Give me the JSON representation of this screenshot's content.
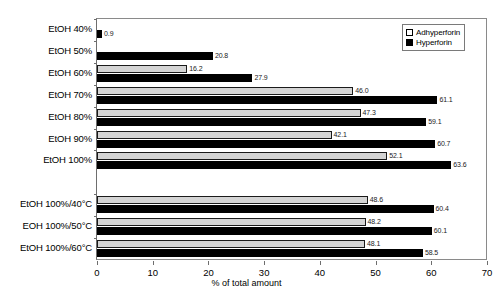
{
  "chart_data": {
    "type": "bar",
    "orientation": "horizontal",
    "title": "",
    "xlabel": "% of total amount",
    "ylabel": "",
    "xlim": [
      0,
      70
    ],
    "xticks": [
      0,
      10,
      20,
      30,
      40,
      50,
      60,
      70
    ],
    "grid": false,
    "legend_position": "top-right",
    "categories": [
      "EtOH 40%",
      "EtOH 50%",
      "EtOH 60%",
      "EtOH 70%",
      "EtOH 80%",
      "EtOH 90%",
      "EtOH 100%",
      "EtOH 100%/40°C",
      "EOH 100%/50°C",
      "EtOH 100%/60°C"
    ],
    "group_break_after_index": 6,
    "series": [
      {
        "name": "Adhyperforin",
        "color": "#d4d4d4",
        "border_color": "#000000",
        "values": [
          null,
          null,
          16.2,
          46.0,
          47.3,
          42.1,
          52.1,
          48.6,
          48.2,
          48.1
        ],
        "labels": [
          "",
          "",
          "16.2",
          "46.0",
          "47.3",
          "42.1",
          "52.1",
          "48.6",
          "48.2",
          "48.1"
        ]
      },
      {
        "name": "Hyperforin",
        "color": "#000000",
        "border_color": "#000000",
        "values": [
          0.9,
          20.8,
          27.9,
          61.1,
          59.1,
          60.7,
          63.6,
          60.4,
          60.1,
          58.5
        ],
        "labels": [
          "0.9",
          "20.8",
          "27.9",
          "61.1",
          "59.1",
          "60.7",
          "63.6",
          "60.4",
          "60.1",
          "58.5"
        ]
      }
    ]
  }
}
